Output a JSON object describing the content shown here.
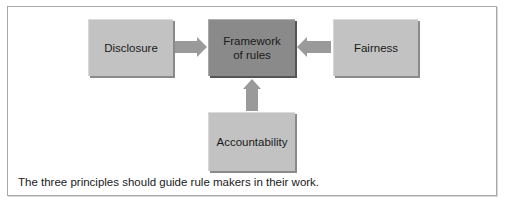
{
  "diagram": {
    "nodes": {
      "disclosure": {
        "label": "Disclosure"
      },
      "framework": {
        "label_line1": "Framework",
        "label_line2": "of rules"
      },
      "fairness": {
        "label": "Fairness"
      },
      "accountability": {
        "label": "Accountability"
      }
    },
    "edges": [
      {
        "from": "Disclosure",
        "to": "Framework of rules"
      },
      {
        "from": "Fairness",
        "to": "Framework of rules"
      },
      {
        "from": "Accountability",
        "to": "Framework of rules"
      }
    ],
    "caption": "The three principles should guide rule makers in their work.",
    "colors": {
      "outer_box_fill": "#c2c2c2",
      "center_box_fill": "#8a8a8a",
      "arrow_fill": "#9a9a9a",
      "frame_border": "#a8a8a8"
    }
  }
}
